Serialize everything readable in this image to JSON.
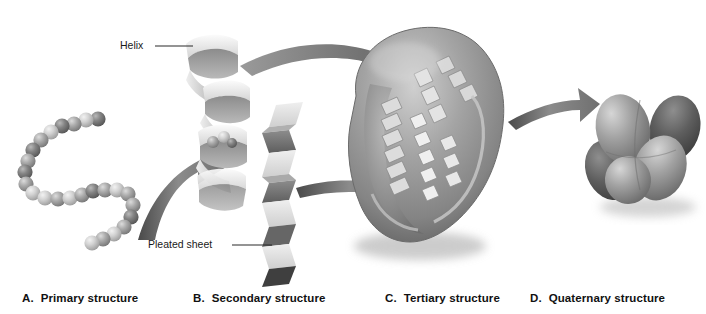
{
  "figure": {
    "background": "#ffffff",
    "palette": {
      "bead_light": "#d8d8d8",
      "bead_mid": "#a9a9a9",
      "bead_dark": "#6e6e6e",
      "ribbon_light": "#ededed",
      "ribbon_shade": "#8f8f8f",
      "sheet_light": "#e2e2e2",
      "sheet_dark": "#3a3a3a",
      "blob_mid": "#9a9a9a",
      "blob_highlight": "#c9c9c9",
      "blob_shadow": "#5f5f5f",
      "arrow_fill": "#7d7d7d",
      "text": "#111111",
      "leader_line": "#2a2a2a"
    }
  },
  "callouts": [
    {
      "id": "helix",
      "label": "Helix"
    },
    {
      "id": "pleated-sheet",
      "label": "Pleated sheet"
    }
  ],
  "captions": [
    {
      "letter": "A.",
      "text": "Primary structure"
    },
    {
      "letter": "B.",
      "text": "Secondary structure"
    },
    {
      "letter": "C.",
      "text": "Tertiary structure"
    },
    {
      "letter": "D.",
      "text": "Quaternary structure"
    }
  ],
  "panels": {
    "primary": {
      "name": "bead-chain",
      "bead_count": 22
    },
    "secondary": {
      "name": "helix-and-sheet",
      "helix_turns": 4,
      "sheet_pleats": 7
    },
    "tertiary": {
      "name": "folded-globule",
      "motifs": "helices and sheets"
    },
    "quaternary": {
      "name": "subunit-cluster",
      "subunits": 4
    }
  },
  "arrows": [
    {
      "id": "arrow-primary-to-secondary",
      "from": "primary",
      "to": "secondary"
    },
    {
      "id": "arrow-helix-to-tertiary",
      "from": "helix",
      "to": "tertiary"
    },
    {
      "id": "arrow-sheet-to-tertiary",
      "from": "sheet",
      "to": "tertiary"
    },
    {
      "id": "arrow-tertiary-to-quaternary",
      "from": "tertiary",
      "to": "quaternary"
    }
  ]
}
